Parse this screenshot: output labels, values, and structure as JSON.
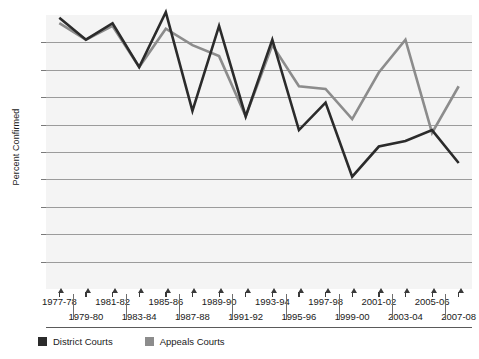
{
  "chart_data": {
    "type": "line",
    "title": "",
    "xlabel": "",
    "ylabel": "Percent Confirmed",
    "ylim": [
      0,
      100
    ],
    "ytick_values": [
      100,
      90,
      80,
      70,
      60,
      50,
      40,
      30,
      20,
      10,
      0
    ],
    "ytick_labels": [
      "100",
      "90",
      "80",
      "70",
      "60",
      "50",
      "40",
      "30",
      "20",
      "10",
      "0"
    ],
    "grid": true,
    "legend_position": "bottom-left",
    "categories": [
      "1977-78",
      "1979-80",
      "1981-82",
      "1983-84",
      "1985-86",
      "1987-88",
      "1989-90",
      "1991-92",
      "1993-94",
      "1995-96",
      "1997-98",
      "1999-00",
      "2001-02",
      "2003-04",
      "2005-06",
      "2007-08"
    ],
    "xtick_labels_row1": [
      "1977-78",
      "1981-82",
      "1985-86",
      "1989-90",
      "1993-94",
      "1997-98",
      "2001-02",
      "2005-06"
    ],
    "xtick_labels_row2": [
      "1979-80",
      "1983-84",
      "1987-88",
      "1991-92",
      "1995-96",
      "1999-00",
      "2003-04",
      "2007-08"
    ],
    "series": [
      {
        "name": "District Courts",
        "color": "#2b2b2b",
        "values": [
          99,
          91,
          97,
          81,
          101,
          65,
          96,
          63,
          91,
          58,
          68,
          41,
          52,
          54,
          58,
          46
        ]
      },
      {
        "name": "Appeals Courts",
        "color": "#8c8c8c",
        "values": [
          97,
          91,
          96,
          81,
          95,
          89,
          85,
          63,
          89,
          74,
          73,
          62,
          79,
          91,
          57,
          74
        ]
      }
    ]
  },
  "legend": {
    "items": [
      {
        "label": "District Courts",
        "color": "#2b2b2b"
      },
      {
        "label": "Appeals Courts",
        "color": "#8c8c8c"
      }
    ]
  }
}
